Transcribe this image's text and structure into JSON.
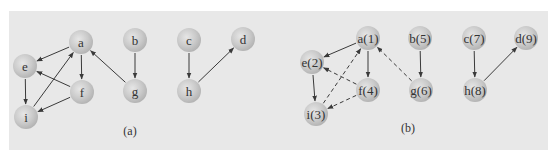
{
  "figure": {
    "panels": [
      {
        "caption": "(a)",
        "caption_pos": [
          130,
          135
        ],
        "nodes": [
          {
            "id": "a",
            "label": "a",
            "x": 81,
            "y": 42
          },
          {
            "id": "b",
            "label": "b",
            "x": 135,
            "y": 40
          },
          {
            "id": "c",
            "label": "c",
            "x": 189,
            "y": 40
          },
          {
            "id": "d",
            "label": "d",
            "x": 243,
            "y": 39
          },
          {
            "id": "e",
            "label": "e",
            "x": 25,
            "y": 66
          },
          {
            "id": "f",
            "label": "f",
            "x": 82,
            "y": 92
          },
          {
            "id": "g",
            "label": "g",
            "x": 135,
            "y": 91
          },
          {
            "id": "h",
            "label": "h",
            "x": 189,
            "y": 91
          },
          {
            "id": "i",
            "label": "i",
            "x": 26,
            "y": 117
          }
        ],
        "edges": [
          {
            "from": "a",
            "to": "e",
            "style": "solid"
          },
          {
            "from": "a",
            "to": "f",
            "style": "solid"
          },
          {
            "from": "e",
            "to": "i",
            "style": "solid"
          },
          {
            "from": "f",
            "to": "e",
            "style": "solid"
          },
          {
            "from": "f",
            "to": "i",
            "style": "solid"
          },
          {
            "from": "i",
            "to": "a",
            "style": "solid"
          },
          {
            "from": "g",
            "to": "a",
            "style": "solid"
          },
          {
            "from": "b",
            "to": "g",
            "style": "solid"
          },
          {
            "from": "c",
            "to": "h",
            "style": "solid"
          },
          {
            "from": "h",
            "to": "d",
            "style": "solid"
          }
        ]
      },
      {
        "caption": "(b)",
        "caption_pos": [
          408,
          132
        ],
        "nodes": [
          {
            "id": "a",
            "label": "a(1)",
            "x": 368,
            "y": 38
          },
          {
            "id": "b",
            "label": "b(5)",
            "x": 420,
            "y": 38
          },
          {
            "id": "c",
            "label": "c(7)",
            "x": 474,
            "y": 38
          },
          {
            "id": "d",
            "label": "d(9)",
            "x": 526,
            "y": 38
          },
          {
            "id": "e",
            "label": "e(2)",
            "x": 312,
            "y": 62
          },
          {
            "id": "f",
            "label": "f(4)",
            "x": 368,
            "y": 90
          },
          {
            "id": "g",
            "label": "g(6)",
            "x": 421,
            "y": 90
          },
          {
            "id": "h",
            "label": "h(8)",
            "x": 475,
            "y": 90
          },
          {
            "id": "i",
            "label": "i(3)",
            "x": 316,
            "y": 114
          }
        ],
        "edges": [
          {
            "from": "a",
            "to": "e",
            "style": "solid"
          },
          {
            "from": "a",
            "to": "f",
            "style": "solid"
          },
          {
            "from": "e",
            "to": "i",
            "style": "solid"
          },
          {
            "from": "f",
            "to": "e",
            "style": "dashed"
          },
          {
            "from": "f",
            "to": "i",
            "style": "dashed"
          },
          {
            "from": "i",
            "to": "a",
            "style": "dashed"
          },
          {
            "from": "g",
            "to": "a",
            "style": "dashed"
          },
          {
            "from": "b",
            "to": "g",
            "style": "solid"
          },
          {
            "from": "c",
            "to": "h",
            "style": "solid"
          },
          {
            "from": "h",
            "to": "d",
            "style": "solid"
          }
        ]
      }
    ],
    "colors": {
      "background": "#e8e8e8",
      "node_fill": "#c4c4c4",
      "node_highlight": "#e6e6e6",
      "edge": "#3a3a3a",
      "text": "#333333"
    },
    "node_radius": 12
  }
}
